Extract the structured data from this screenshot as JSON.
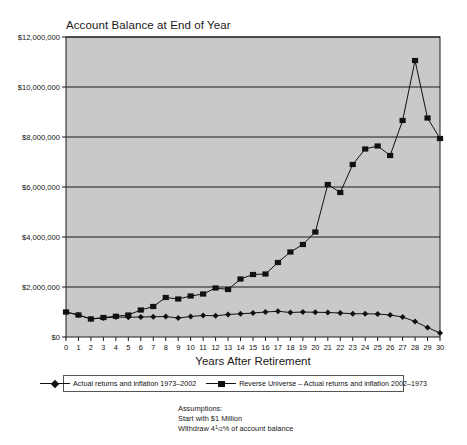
{
  "chart_data": {
    "type": "line",
    "title": "Account Balance at End of Year",
    "xlabel": "Years After Retirement",
    "ylabel": "",
    "grid": true,
    "legend_position": "bottom",
    "xlim": [
      0,
      30
    ],
    "ylim": [
      0,
      12000000
    ],
    "x": [
      0,
      1,
      2,
      3,
      4,
      5,
      6,
      7,
      8,
      9,
      10,
      11,
      12,
      13,
      14,
      15,
      16,
      17,
      18,
      19,
      20,
      21,
      22,
      23,
      24,
      25,
      26,
      27,
      28,
      29,
      30
    ],
    "ytick_labels": [
      "$0",
      "$2,000,000",
      "$4,000,000",
      "$6,000,000",
      "$8,000,000",
      "$10,000,000",
      "$12,000,000"
    ],
    "ytick_values": [
      0,
      2000000,
      4000000,
      6000000,
      8000000,
      10000000,
      12000000
    ],
    "xtick_labels": [
      "0",
      "1",
      "2",
      "3",
      "4",
      "5",
      "6",
      "7",
      "8",
      "9",
      "10",
      "11",
      "12",
      "13",
      "14",
      "15",
      "16",
      "17",
      "18",
      "19",
      "20",
      "21",
      "22",
      "23",
      "24",
      "25",
      "26",
      "27",
      "28",
      "29",
      "30"
    ],
    "series": [
      {
        "name": "Actual returns and inflation 1973–2002",
        "marker": "diamond",
        "color": "#111111",
        "values": [
          1000000,
          880000,
          720000,
          760000,
          800000,
          790000,
          800000,
          810000,
          820000,
          760000,
          820000,
          860000,
          850000,
          900000,
          930000,
          960000,
          1000000,
          1030000,
          980000,
          1000000,
          990000,
          980000,
          960000,
          930000,
          930000,
          920000,
          880000,
          800000,
          620000,
          380000,
          160000
        ]
      },
      {
        "name": "Reverse Universe – Actual returns and inflation 2002–1973",
        "marker": "square",
        "color": "#111111",
        "values": [
          1000000,
          880000,
          720000,
          780000,
          830000,
          880000,
          1080000,
          1220000,
          1580000,
          1520000,
          1640000,
          1720000,
          1960000,
          1900000,
          2320000,
          2500000,
          2520000,
          2980000,
          3400000,
          3700000,
          4200000,
          6100000,
          5780000,
          6900000,
          7520000,
          7640000,
          7260000,
          8660000,
          11060000,
          8760000,
          7940000
        ]
      }
    ]
  },
  "legend": {
    "entries": [
      {
        "label": "Actual returns and inflation 1973–2002",
        "marker": "diamond"
      },
      {
        "label": "Reverse Universe – Actual returns and inflation 2002–1973",
        "marker": "square"
      }
    ]
  },
  "assumptions": {
    "heading": "Assumptions:",
    "line1": "Start with $1 Million",
    "line2_prefix": "Withdraw 4",
    "line2_num": "1",
    "line2_den": "2",
    "line2_suffix": "% of account balance"
  },
  "colors": {
    "plot_background": "#c9c9c9",
    "axis": "#1a1a1a",
    "series": "#111111",
    "page_background": "#ffffff"
  }
}
